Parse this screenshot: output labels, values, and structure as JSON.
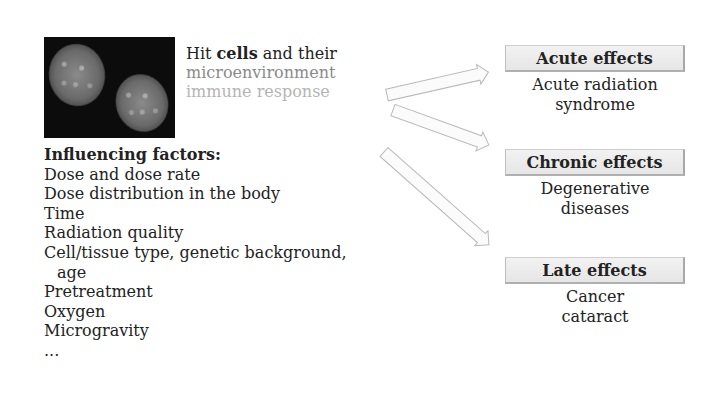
{
  "figure": {
    "image": {
      "description": "Fluorescence micrograph of two cell nuclei on dark background",
      "icon": "cell-nuclei-image"
    },
    "hit_text": {
      "prefix": "Hit ",
      "bold": "cells",
      "suffix": " and their",
      "line2": "microenvironment",
      "line3": "immune response",
      "colors": {
        "line1": "#222222",
        "line2": "#8a8a8a",
        "line3": "#b4b4b4"
      }
    },
    "influencing_factors": {
      "title": "Influencing factors:",
      "items": [
        "Dose and dose rate",
        "Dose distribution in the body",
        "Time",
        "Radiation quality",
        "Cell/tissue type, genetic background,",
        "age",
        "Pretreatment",
        "Oxygen",
        "Microgravity",
        "..."
      ]
    },
    "effects": [
      {
        "label": "Acute effects",
        "description_lines": [
          "Acute radiation",
          "syndrome"
        ]
      },
      {
        "label": "Chronic effects",
        "description_lines": [
          "Degenerative",
          "diseases"
        ]
      },
      {
        "label": "Late effects",
        "description_lines": [
          "Cancer",
          "cataract"
        ]
      }
    ],
    "arrows": [
      {
        "from": [
          387,
          95
        ],
        "to": [
          489,
          72
        ],
        "target": "Acute effects"
      },
      {
        "from": [
          393,
          110
        ],
        "to": [
          489,
          145
        ],
        "target": "Chronic effects"
      },
      {
        "from": [
          384,
          152
        ],
        "to": [
          489,
          245
        ],
        "target": "Late effects"
      }
    ],
    "colors": {
      "box_fill": "#ececec",
      "box_border": "#b0b0b0",
      "arrow_stroke": "#b8b8b8",
      "text": "#222222"
    }
  }
}
